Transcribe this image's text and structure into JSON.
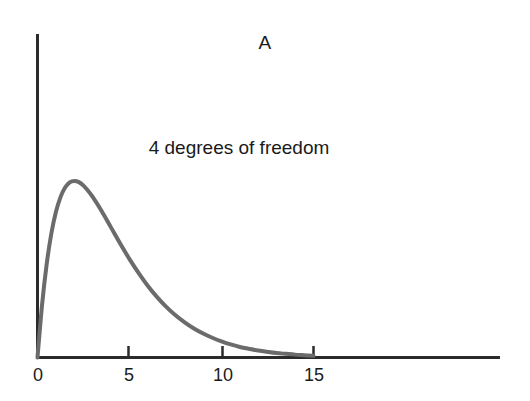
{
  "figure": {
    "panel_label": "A",
    "annotation": "4 degrees of freedom",
    "background_color": "#ffffff",
    "axis_color": "#2b2b2b",
    "curve_color": "#6b6b6b"
  },
  "axes": {
    "x_tick_labels": [
      "0",
      "5",
      "10",
      "15"
    ],
    "x_ticks": [
      0,
      5,
      10,
      15
    ],
    "y_tick_labels": []
  },
  "chart_data": {
    "type": "line",
    "title": "A",
    "subtitle": "",
    "xlabel": "",
    "ylabel": "",
    "xlim": [
      0,
      25
    ],
    "ylim": [
      0,
      0.21
    ],
    "grid": false,
    "legend": null,
    "annotations": [
      {
        "text": "4 degrees of freedom",
        "x": 8.2,
        "y": 0.155
      },
      {
        "text": "A",
        "x": 12.0,
        "y": 0.205
      }
    ],
    "xticks": [
      0,
      5,
      10,
      15
    ],
    "xticklabels": [
      "0",
      "5",
      "10",
      "15"
    ],
    "yticks": [],
    "yticklabels": [],
    "series": [
      {
        "name": "chi-square pdf, df = 4",
        "color": "#6b6b6b",
        "line_width": 4,
        "x": [
          0.0,
          0.25,
          0.5,
          0.75,
          1.0,
          1.25,
          1.5,
          1.75,
          2.0,
          2.25,
          2.5,
          2.75,
          3.0,
          3.5,
          4.0,
          4.5,
          5.0,
          5.5,
          6.0,
          6.5,
          7.0,
          7.5,
          8.0,
          8.5,
          9.0,
          9.5,
          10.0,
          10.5,
          11.0,
          11.5,
          12.0,
          12.5,
          13.0,
          13.5,
          14.0,
          14.5,
          15.0
        ],
        "y": [
          0.0,
          0.0276,
          0.0487,
          0.0645,
          0.0758,
          0.0836,
          0.0886,
          0.0913,
          0.092,
          0.0914,
          0.0896,
          0.0869,
          0.0837,
          0.0761,
          0.0677,
          0.0593,
          0.0513,
          0.044,
          0.0373,
          0.0315,
          0.0264,
          0.022,
          0.0183,
          0.0151,
          0.0125,
          0.0103,
          0.0084,
          0.0068,
          0.0055,
          0.0045,
          0.0036,
          0.0029,
          0.0023,
          0.0019,
          0.0015,
          0.0012,
          0.0009
        ]
      }
    ],
    "peak": {
      "x": 2.0,
      "y": 0.092
    }
  }
}
